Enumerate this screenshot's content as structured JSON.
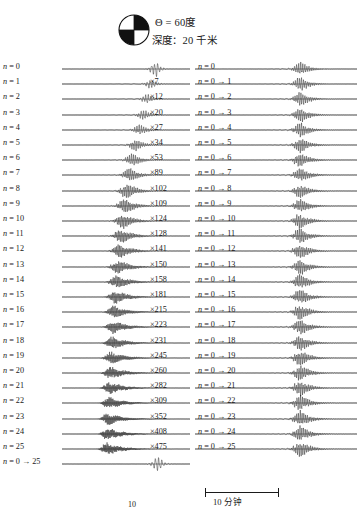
{
  "figure": {
    "title_present": false,
    "background": "#ffffff",
    "ink": "#1a1a1a"
  },
  "header": {
    "focal_mechanism_icon": "beachball-icon",
    "quadrants": [
      "white",
      "black",
      "black",
      "white"
    ],
    "theta_label": "Θ = 60度",
    "depth_label": "深度：20 千米"
  },
  "scale": {
    "label": "10 分钟",
    "tick_label": "10"
  },
  "chart_data": {
    "type": "line",
    "title": "",
    "xlabel": "",
    "ylabel": "",
    "time_axis_minutes": [
      0,
      60
    ],
    "left_panel": {
      "name": "individual-modes",
      "rows": [
        {
          "label": "n = 0",
          "mult": "",
          "gain": 1,
          "amp": 1.0,
          "center": 0.74,
          "width": 0.06,
          "freq": 42,
          "tail": 0.03,
          "pre": 0.0
        },
        {
          "label": "n = 1",
          "mult": "×7",
          "gain": 7,
          "amp": 0.62,
          "center": 0.7,
          "width": 0.055,
          "freq": 46,
          "tail": 0.045,
          "pre": 0.12
        },
        {
          "label": "n = 2",
          "mult": "×12",
          "gain": 12,
          "amp": 0.66,
          "center": 0.67,
          "width": 0.055,
          "freq": 50,
          "tail": 0.05,
          "pre": 0.15
        },
        {
          "label": "n = 3",
          "mult": "×20",
          "gain": 20,
          "amp": 0.7,
          "center": 0.64,
          "width": 0.055,
          "freq": 54,
          "tail": 0.055,
          "pre": 0.165
        },
        {
          "label": "n = 4",
          "mult": "×27",
          "gain": 27,
          "amp": 0.74,
          "center": 0.61,
          "width": 0.058,
          "freq": 58,
          "tail": 0.06,
          "pre": 0.18
        },
        {
          "label": "n = 5",
          "mult": "×34",
          "gain": 34,
          "amp": 0.78,
          "center": 0.58,
          "width": 0.06,
          "freq": 62,
          "tail": 0.065,
          "pre": 0.195
        },
        {
          "label": "n = 6",
          "mult": "×53",
          "gain": 53,
          "amp": 0.84,
          "center": 0.555,
          "width": 0.062,
          "freq": 66,
          "tail": 0.07,
          "pre": 0.205
        },
        {
          "label": "n = 7",
          "mult": "×89",
          "gain": 89,
          "amp": 0.92,
          "center": 0.535,
          "width": 0.066,
          "freq": 70,
          "tail": 0.075,
          "pre": 0.215
        },
        {
          "label": "n = 8",
          "mult": "×102",
          "gain": 102,
          "amp": 1.0,
          "center": 0.515,
          "width": 0.068,
          "freq": 74,
          "tail": 0.08,
          "pre": 0.225
        },
        {
          "label": "n = 9",
          "mult": "×109",
          "gain": 109,
          "amp": 0.96,
          "center": 0.498,
          "width": 0.068,
          "freq": 78,
          "tail": 0.085,
          "pre": 0.23
        },
        {
          "label": "n = 10",
          "mult": "×124",
          "gain": 124,
          "amp": 0.94,
          "center": 0.482,
          "width": 0.068,
          "freq": 82,
          "tail": 0.09,
          "pre": 0.235
        },
        {
          "label": "n = 11",
          "mult": "×128",
          "gain": 128,
          "amp": 0.92,
          "center": 0.468,
          "width": 0.066,
          "freq": 86,
          "tail": 0.095,
          "pre": 0.24
        },
        {
          "label": "n = 12",
          "mult": "×141",
          "gain": 141,
          "amp": 0.9,
          "center": 0.455,
          "width": 0.065,
          "freq": 90,
          "tail": 0.1,
          "pre": 0.245
        },
        {
          "label": "n = 13",
          "mult": "×150",
          "gain": 150,
          "amp": 0.88,
          "center": 0.443,
          "width": 0.064,
          "freq": 94,
          "tail": 0.105,
          "pre": 0.248
        },
        {
          "label": "n = 14",
          "mult": "×158",
          "gain": 158,
          "amp": 0.87,
          "center": 0.432,
          "width": 0.063,
          "freq": 98,
          "tail": 0.108,
          "pre": 0.25
        },
        {
          "label": "n = 15",
          "mult": "×181",
          "gain": 181,
          "amp": 0.86,
          "center": 0.422,
          "width": 0.062,
          "freq": 102,
          "tail": 0.11,
          "pre": 0.252
        },
        {
          "label": "n = 16",
          "mult": "×215",
          "gain": 215,
          "amp": 0.85,
          "center": 0.413,
          "width": 0.061,
          "freq": 106,
          "tail": 0.112,
          "pre": 0.254
        },
        {
          "label": "n = 17",
          "mult": "×223",
          "gain": 223,
          "amp": 0.84,
          "center": 0.404,
          "width": 0.06,
          "freq": 110,
          "tail": 0.114,
          "pre": 0.256
        },
        {
          "label": "n = 18",
          "mult": "×231",
          "gain": 231,
          "amp": 0.83,
          "center": 0.396,
          "width": 0.059,
          "freq": 114,
          "tail": 0.116,
          "pre": 0.258
        },
        {
          "label": "n = 19",
          "mult": "×245",
          "gain": 245,
          "amp": 0.82,
          "center": 0.389,
          "width": 0.058,
          "freq": 118,
          "tail": 0.118,
          "pre": 0.26
        },
        {
          "label": "n = 20",
          "mult": "×260",
          "gain": 260,
          "amp": 0.82,
          "center": 0.382,
          "width": 0.057,
          "freq": 122,
          "tail": 0.12,
          "pre": 0.262
        },
        {
          "label": "n = 21",
          "mult": "×282",
          "gain": 282,
          "amp": 0.81,
          "center": 0.375,
          "width": 0.056,
          "freq": 126,
          "tail": 0.122,
          "pre": 0.263
        },
        {
          "label": "n = 22",
          "mult": "×309",
          "gain": 309,
          "amp": 0.8,
          "center": 0.369,
          "width": 0.055,
          "freq": 130,
          "tail": 0.124,
          "pre": 0.264
        },
        {
          "label": "n = 23",
          "mult": "×352",
          "gain": 352,
          "amp": 0.8,
          "center": 0.363,
          "width": 0.054,
          "freq": 134,
          "tail": 0.126,
          "pre": 0.265
        },
        {
          "label": "n = 24",
          "mult": "×408",
          "gain": 408,
          "amp": 0.79,
          "center": 0.358,
          "width": 0.053,
          "freq": 138,
          "tail": 0.128,
          "pre": 0.266
        },
        {
          "label": "n = 25",
          "mult": "×475",
          "gain": 475,
          "amp": 0.79,
          "center": 0.353,
          "width": 0.052,
          "freq": 142,
          "tail": 0.13,
          "pre": 0.267
        },
        {
          "label": "n = 0 → 25",
          "mult": "",
          "gain": 1,
          "amp": 1.05,
          "center": 0.76,
          "width": 0.062,
          "freq": 40,
          "tail": 0.028,
          "pre": 0.0
        }
      ]
    },
    "right_panel": {
      "name": "cumulative-sums",
      "rows": [
        {
          "label": "n = 0",
          "amp": 0.95,
          "center": 0.655,
          "width": 0.05,
          "freq": 80,
          "tail": 0.055,
          "pre": 0.33
        },
        {
          "label": "n = 0 → 1",
          "amp": 0.97,
          "center": 0.655,
          "width": 0.05,
          "freq": 82,
          "tail": 0.056,
          "pre": 0.33
        },
        {
          "label": "n = 0 → 2",
          "amp": 0.98,
          "center": 0.655,
          "width": 0.05,
          "freq": 84,
          "tail": 0.057,
          "pre": 0.33
        },
        {
          "label": "n = 0 → 3",
          "amp": 0.99,
          "center": 0.655,
          "width": 0.05,
          "freq": 85,
          "tail": 0.058,
          "pre": 0.33
        },
        {
          "label": "n = 0 → 4",
          "amp": 1.0,
          "center": 0.655,
          "width": 0.051,
          "freq": 86,
          "tail": 0.058,
          "pre": 0.33
        },
        {
          "label": "n = 0 → 5",
          "amp": 1.0,
          "center": 0.655,
          "width": 0.051,
          "freq": 87,
          "tail": 0.059,
          "pre": 0.33
        },
        {
          "label": "n = 0 → 6",
          "amp": 1.01,
          "center": 0.655,
          "width": 0.051,
          "freq": 88,
          "tail": 0.059,
          "pre": 0.33
        },
        {
          "label": "n = 0 → 7",
          "amp": 1.01,
          "center": 0.655,
          "width": 0.051,
          "freq": 88,
          "tail": 0.06,
          "pre": 0.33
        },
        {
          "label": "n = 0 → 8",
          "amp": 1.02,
          "center": 0.655,
          "width": 0.051,
          "freq": 89,
          "tail": 0.06,
          "pre": 0.33
        },
        {
          "label": "n = 0 → 9",
          "amp": 1.02,
          "center": 0.655,
          "width": 0.051,
          "freq": 89,
          "tail": 0.06,
          "pre": 0.33
        },
        {
          "label": "n = 0 → 10",
          "amp": 1.02,
          "center": 0.655,
          "width": 0.052,
          "freq": 90,
          "tail": 0.061,
          "pre": 0.33
        },
        {
          "label": "n = 0 → 11",
          "amp": 1.03,
          "center": 0.655,
          "width": 0.052,
          "freq": 90,
          "tail": 0.061,
          "pre": 0.33
        },
        {
          "label": "n = 0 → 12",
          "amp": 1.03,
          "center": 0.655,
          "width": 0.052,
          "freq": 90,
          "tail": 0.061,
          "pre": 0.33
        },
        {
          "label": "n = 0 → 13",
          "amp": 1.03,
          "center": 0.655,
          "width": 0.052,
          "freq": 91,
          "tail": 0.062,
          "pre": 0.33
        },
        {
          "label": "n = 0 → 14",
          "amp": 1.03,
          "center": 0.655,
          "width": 0.052,
          "freq": 91,
          "tail": 0.062,
          "pre": 0.33
        },
        {
          "label": "n = 0 → 15",
          "amp": 1.04,
          "center": 0.655,
          "width": 0.052,
          "freq": 91,
          "tail": 0.062,
          "pre": 0.33
        },
        {
          "label": "n = 0 → 16",
          "amp": 1.04,
          "center": 0.655,
          "width": 0.052,
          "freq": 91,
          "tail": 0.062,
          "pre": 0.33
        },
        {
          "label": "n = 0 → 17",
          "amp": 1.04,
          "center": 0.655,
          "width": 0.052,
          "freq": 92,
          "tail": 0.063,
          "pre": 0.33
        },
        {
          "label": "n = 0 → 18",
          "amp": 1.04,
          "center": 0.655,
          "width": 0.052,
          "freq": 92,
          "tail": 0.063,
          "pre": 0.33
        },
        {
          "label": "n = 0 → 19",
          "amp": 1.04,
          "center": 0.655,
          "width": 0.052,
          "freq": 92,
          "tail": 0.063,
          "pre": 0.33
        },
        {
          "label": "n = 0 → 20",
          "amp": 1.05,
          "center": 0.655,
          "width": 0.052,
          "freq": 92,
          "tail": 0.063,
          "pre": 0.33
        },
        {
          "label": "n = 0 → 21",
          "amp": 1.05,
          "center": 0.655,
          "width": 0.052,
          "freq": 92,
          "tail": 0.063,
          "pre": 0.33
        },
        {
          "label": "n = 0 → 22",
          "amp": 1.05,
          "center": 0.655,
          "width": 0.052,
          "freq": 92,
          "tail": 0.063,
          "pre": 0.33
        },
        {
          "label": "n = 0 → 23",
          "amp": 1.05,
          "center": 0.655,
          "width": 0.052,
          "freq": 93,
          "tail": 0.064,
          "pre": 0.33
        },
        {
          "label": "n = 0 → 24",
          "amp": 1.05,
          "center": 0.655,
          "width": 0.052,
          "freq": 93,
          "tail": 0.064,
          "pre": 0.33
        },
        {
          "label": "n = 0 → 25",
          "amp": 1.05,
          "center": 0.655,
          "width": 0.052,
          "freq": 93,
          "tail": 0.064,
          "pre": 0.33
        }
      ]
    }
  }
}
